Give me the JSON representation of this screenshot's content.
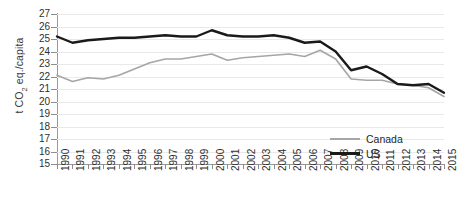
{
  "chart_data": {
    "type": "line",
    "title": "",
    "xlabel": "",
    "ylabel": "t CO2 eq./capita",
    "ylabel_prefix": "t CO",
    "ylabel_sub": "2",
    "ylabel_suffix": " eq./capita",
    "ylim": [
      15,
      27
    ],
    "y_ticks": [
      27,
      26,
      25,
      24,
      23,
      22,
      21,
      20,
      19,
      18,
      17,
      16,
      15
    ],
    "grid": true,
    "legend_position": "bottom-right",
    "x": [
      1990,
      1991,
      1992,
      1993,
      1994,
      1995,
      1996,
      1997,
      1998,
      1999,
      2000,
      2001,
      2002,
      2003,
      2004,
      2005,
      2006,
      2007,
      2008,
      2009,
      2010,
      2011,
      2012,
      2013,
      2014,
      2015
    ],
    "categories": [
      "1990",
      "1991",
      "1992",
      "1993",
      "1994",
      "1995",
      "1996",
      "1997",
      "1998",
      "1999",
      "2000",
      "2001",
      "2002",
      "2003",
      "2004",
      "2005",
      "2006",
      "2007",
      "2008",
      "2009",
      "2010",
      "2011",
      "2012",
      "2013",
      "2014",
      "2015"
    ],
    "series": [
      {
        "name": "Canada",
        "color": "#a6a6a6",
        "values": [
          22.1,
          21.6,
          21.9,
          21.8,
          22.1,
          22.6,
          23.1,
          23.4,
          23.4,
          23.6,
          23.8,
          23.3,
          23.5,
          23.6,
          23.7,
          23.8,
          23.6,
          24.1,
          23.4,
          21.8,
          21.7,
          21.7,
          21.4,
          21.3,
          21.1,
          20.4
        ]
      },
      {
        "name": "US",
        "color": "#1a1a1a",
        "values": [
          25.2,
          24.7,
          24.9,
          25.0,
          25.1,
          25.1,
          25.2,
          25.3,
          25.2,
          25.2,
          25.7,
          25.3,
          25.2,
          25.2,
          25.3,
          25.1,
          24.7,
          24.8,
          24.0,
          22.5,
          22.8,
          22.2,
          21.4,
          21.3,
          21.4,
          20.7
        ]
      }
    ]
  },
  "legend": {
    "items": [
      {
        "label": "Canada",
        "color": "#a6a6a6"
      },
      {
        "label": "US",
        "color": "#1a1a1a"
      }
    ]
  }
}
